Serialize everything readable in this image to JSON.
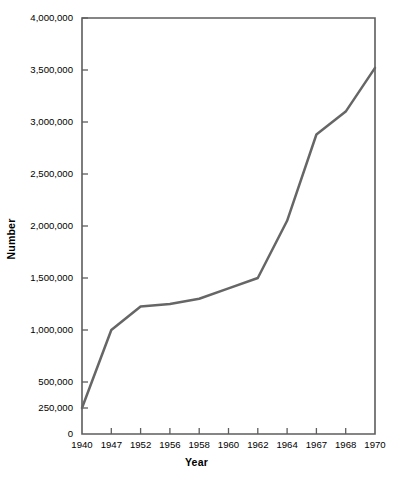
{
  "chart_data": {
    "type": "line",
    "title": "",
    "xlabel": "Year",
    "ylabel": "Number",
    "categories": [
      "1940",
      "1947",
      "1952",
      "1956",
      "1958",
      "1960",
      "1962",
      "1964",
      "1967",
      "1968",
      "1970"
    ],
    "values": [
      250000,
      1000000,
      1225000,
      1250000,
      1300000,
      1400000,
      1500000,
      2050000,
      2880000,
      3100000,
      3520000
    ],
    "series": [
      {
        "name": "Number",
        "values": [
          250000,
          1000000,
          1225000,
          1250000,
          1300000,
          1400000,
          1500000,
          2050000,
          2880000,
          3100000,
          3520000
        ]
      }
    ],
    "ylim": [
      0,
      4000000
    ],
    "ytick_values": [
      0,
      250000,
      500000,
      1000000,
      1500000,
      2000000,
      2500000,
      3000000,
      3500000,
      4000000
    ],
    "ytick_labels": [
      "0",
      "250,000",
      "500,000",
      "1,000,000",
      "1,500,000",
      "2,000,000",
      "2,500,000",
      "3,000,000",
      "3,500,000",
      "4,000,000"
    ],
    "xtick_labels": [
      "1940",
      "1947",
      "1952",
      "1956",
      "1958",
      "1960",
      "1962",
      "1964",
      "1967",
      "1968",
      "1970"
    ],
    "grid": false,
    "legend": false,
    "legend_position": "none",
    "line_color": "#666666",
    "axis_color": "#5d5d5d",
    "background_color": "#ffffff",
    "x_axis_scale": "categorical-evenly-spaced"
  }
}
